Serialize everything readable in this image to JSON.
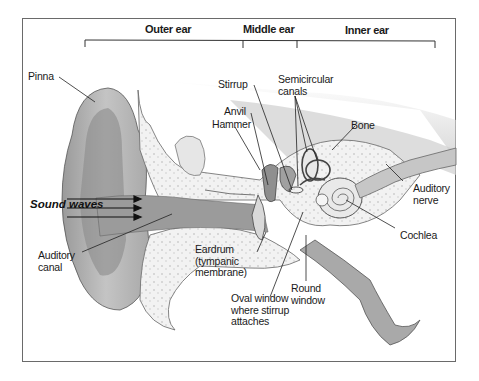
{
  "diagram": {
    "sections": [
      {
        "label": "Outer ear"
      },
      {
        "label": "Middle ear"
      },
      {
        "label": "Inner ear"
      }
    ],
    "labels": {
      "pinna": "Pinna",
      "sound_waves": "Sound\nwaves",
      "auditory_canal": "Auditory\ncanal",
      "stirrup": "Stirrup",
      "anvil": "Anvil",
      "hammer": "Hammer",
      "semicircular_canals": "Semicircular\ncanals",
      "bone": "Bone",
      "auditory_nerve": "Auditory\nnerve",
      "cochlea": "Cochlea",
      "eardrum": "Eardrum\n(tympanic\nmembrane)",
      "round_window": "Round\nwindow",
      "oval_window": "Oval window\nwhere stirrup\nattaches"
    },
    "colors": {
      "frame": "#6a6a6a",
      "text": "#1a1a1a",
      "tissue_dark": "#8c8c8c",
      "tissue_mid": "#bdbdbd",
      "bone_light": "#ededed"
    }
  }
}
